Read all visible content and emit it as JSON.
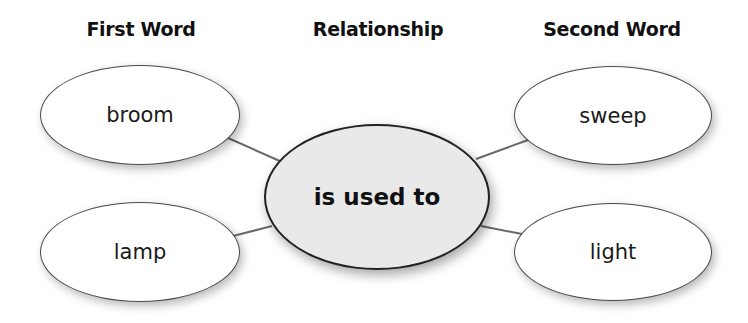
{
  "diagram": {
    "type": "word-relationship-web",
    "headers": {
      "first_word": "First Word",
      "relationship": "Relationship",
      "second_word": "Second Word"
    },
    "relationship": {
      "label": "is used to",
      "fill_color": "#e9e9e9"
    },
    "first_words": [
      {
        "label": "broom"
      },
      {
        "label": "lamp"
      }
    ],
    "second_words": [
      {
        "label": "sweep"
      },
      {
        "label": "light"
      }
    ],
    "connections": [
      {
        "from": "broom",
        "to": "is used to"
      },
      {
        "from": "lamp",
        "to": "is used to"
      },
      {
        "from": "is used to",
        "to": "sweep"
      },
      {
        "from": "is used to",
        "to": "light"
      }
    ],
    "colors": {
      "outline": "#4a4a4a",
      "connector": "#6a6a6a",
      "node_fill": "#ffffff",
      "text": "#111111"
    }
  }
}
